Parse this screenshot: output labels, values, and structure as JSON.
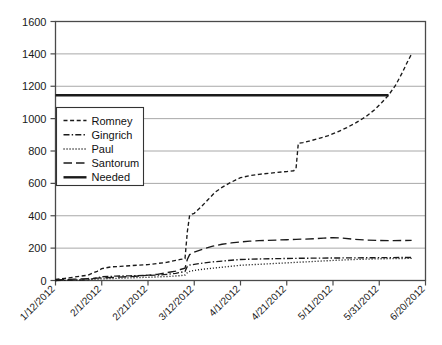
{
  "chart_data": {
    "type": "line",
    "title": "",
    "xlabel": "",
    "ylabel": "",
    "grid": true,
    "legend_position": "upper-left-inside",
    "xlim": [
      0,
      160
    ],
    "ylim": [
      0,
      1600
    ],
    "ytick_values": [
      0,
      200,
      400,
      600,
      800,
      1000,
      1200,
      1400,
      1600
    ],
    "ytick_labels": [
      "0",
      "200",
      "400",
      "600",
      "800",
      "1000",
      "1200",
      "1400",
      "1600"
    ],
    "xtick_values": [
      0,
      20,
      40,
      60,
      80,
      100,
      120,
      140,
      160
    ],
    "xtick_labels": [
      "1/12/2012",
      "2/1/2012",
      "2/21/2012",
      "3/12/2012",
      "4/1/2012",
      "4/21/2012",
      "5/11/2012",
      "5/31/2012",
      "6/20/2012"
    ],
    "series": [
      {
        "name": "Romney",
        "style": "dashed",
        "color": "#1a1a1a",
        "points": [
          [
            0,
            6
          ],
          [
            4,
            13
          ],
          [
            8,
            21
          ],
          [
            14,
            33
          ],
          [
            18,
            57
          ],
          [
            20,
            73
          ],
          [
            24,
            84
          ],
          [
            28,
            87
          ],
          [
            32,
            91
          ],
          [
            36,
            95
          ],
          [
            40,
            98
          ],
          [
            44,
            105
          ],
          [
            48,
            112
          ],
          [
            50,
            118
          ],
          [
            52,
            124
          ],
          [
            54,
            130
          ],
          [
            56,
            135
          ],
          [
            57,
            300
          ],
          [
            58,
            404
          ],
          [
            60,
            415
          ],
          [
            63,
            455
          ],
          [
            66,
            500
          ],
          [
            69,
            545
          ],
          [
            72,
            575
          ],
          [
            75,
            600
          ],
          [
            78,
            622
          ],
          [
            80,
            635
          ],
          [
            84,
            648
          ],
          [
            88,
            656
          ],
          [
            92,
            662
          ],
          [
            96,
            668
          ],
          [
            100,
            673
          ],
          [
            103,
            678
          ],
          [
            104,
            690
          ],
          [
            105,
            848
          ],
          [
            107,
            852
          ],
          [
            110,
            862
          ],
          [
            114,
            878
          ],
          [
            118,
            895
          ],
          [
            122,
            918
          ],
          [
            126,
            945
          ],
          [
            130,
            975
          ],
          [
            134,
            1010
          ],
          [
            138,
            1055
          ],
          [
            141,
            1098
          ],
          [
            144,
            1144
          ],
          [
            147,
            1205
          ],
          [
            150,
            1285
          ],
          [
            152,
            1345
          ],
          [
            154,
            1400
          ]
        ]
      },
      {
        "name": "Gingrich",
        "style": "dashdot",
        "color": "#1a1a1a",
        "points": [
          [
            0,
            0
          ],
          [
            8,
            2
          ],
          [
            14,
            4
          ],
          [
            20,
            23
          ],
          [
            26,
            27
          ],
          [
            32,
            29
          ],
          [
            38,
            31
          ],
          [
            44,
            33
          ],
          [
            48,
            38
          ],
          [
            52,
            44
          ],
          [
            54,
            50
          ],
          [
            56,
            56
          ],
          [
            57,
            86
          ],
          [
            58,
            95
          ],
          [
            60,
            100
          ],
          [
            64,
            108
          ],
          [
            68,
            115
          ],
          [
            72,
            120
          ],
          [
            76,
            125
          ],
          [
            80,
            130
          ],
          [
            88,
            133
          ],
          [
            96,
            135
          ],
          [
            104,
            137
          ],
          [
            112,
            138
          ],
          [
            120,
            139
          ],
          [
            130,
            140
          ],
          [
            140,
            141
          ],
          [
            150,
            142
          ],
          [
            154,
            142
          ]
        ]
      },
      {
        "name": "Paul",
        "style": "dotted",
        "color": "#1a1a1a",
        "points": [
          [
            0,
            0
          ],
          [
            8,
            3
          ],
          [
            14,
            6
          ],
          [
            20,
            10
          ],
          [
            26,
            13
          ],
          [
            32,
            16
          ],
          [
            38,
            19
          ],
          [
            44,
            22
          ],
          [
            50,
            26
          ],
          [
            54,
            30
          ],
          [
            56,
            34
          ],
          [
            57,
            48
          ],
          [
            58,
            56
          ],
          [
            60,
            62
          ],
          [
            64,
            70
          ],
          [
            68,
            76
          ],
          [
            72,
            82
          ],
          [
            76,
            88
          ],
          [
            80,
            94
          ],
          [
            88,
            100
          ],
          [
            96,
            106
          ],
          [
            104,
            112
          ],
          [
            112,
            118
          ],
          [
            120,
            124
          ],
          [
            130,
            130
          ],
          [
            140,
            134
          ],
          [
            150,
            136
          ],
          [
            154,
            137
          ]
        ]
      },
      {
        "name": "Santorum",
        "style": "longdash",
        "color": "#1a1a1a",
        "points": [
          [
            0,
            4
          ],
          [
            8,
            8
          ],
          [
            14,
            12
          ],
          [
            20,
            16
          ],
          [
            26,
            20
          ],
          [
            32,
            24
          ],
          [
            38,
            30
          ],
          [
            44,
            38
          ],
          [
            48,
            48
          ],
          [
            52,
            58
          ],
          [
            54,
            68
          ],
          [
            56,
            76
          ],
          [
            57,
            130
          ],
          [
            58,
            160
          ],
          [
            60,
            175
          ],
          [
            64,
            195
          ],
          [
            68,
            212
          ],
          [
            72,
            224
          ],
          [
            76,
            232
          ],
          [
            80,
            238
          ],
          [
            84,
            243
          ],
          [
            88,
            246
          ],
          [
            92,
            248
          ],
          [
            96,
            250
          ],
          [
            100,
            252
          ],
          [
            104,
            254
          ],
          [
            108,
            256
          ],
          [
            112,
            258
          ],
          [
            116,
            262
          ],
          [
            120,
            265
          ],
          [
            124,
            262
          ],
          [
            128,
            256
          ],
          [
            134,
            250
          ],
          [
            140,
            247
          ],
          [
            146,
            246
          ],
          [
            150,
            247
          ],
          [
            154,
            248
          ]
        ]
      },
      {
        "name": "Needed",
        "style": "solid",
        "color": "#1a1a1a",
        "points": [
          [
            0,
            1144
          ],
          [
            144,
            1144
          ]
        ]
      }
    ]
  },
  "legend": {
    "entries": [
      {
        "label": "Romney",
        "style": "dashed"
      },
      {
        "label": "Gingrich",
        "style": "dashdot"
      },
      {
        "label": "Paul",
        "style": "dotted"
      },
      {
        "label": "Santorum",
        "style": "longdash"
      },
      {
        "label": "Needed",
        "style": "solid"
      }
    ]
  },
  "colors": {
    "line": "#1a1a1a",
    "grid": "#a8a8a8",
    "axis": "#4a4a4a",
    "background": "#ffffff",
    "legend_border": "#333333"
  }
}
